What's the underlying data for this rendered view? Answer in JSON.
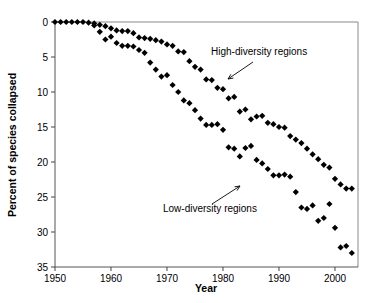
{
  "chart_data": {
    "type": "scatter",
    "title": "",
    "xlabel": "Year",
    "ylabel": "Percent of species collapsed",
    "xlim": [
      1950,
      2004
    ],
    "ylim": [
      0,
      35
    ],
    "y_inverted": true,
    "grid": false,
    "legend_position": "inline-annotations",
    "xticks": [
      1950,
      1960,
      1970,
      1980,
      1990,
      2000
    ],
    "xtick_labels": [
      "1950",
      "1960",
      "1970",
      "1980",
      "1990",
      "2000"
    ],
    "yticks": [
      0,
      5,
      10,
      15,
      20,
      25,
      30,
      35
    ],
    "ytick_labels": [
      "0",
      "5",
      "10",
      "15",
      "20",
      "25",
      "30",
      "35"
    ],
    "marker": "diamond",
    "marker_color": "#000000",
    "series": [
      {
        "name": "High-diversity regions",
        "x": [
          1950,
          1951,
          1952,
          1953,
          1954,
          1955,
          1956,
          1957,
          1958,
          1959,
          1960,
          1961,
          1962,
          1963,
          1964,
          1965,
          1966,
          1967,
          1968,
          1969,
          1970,
          1971,
          1972,
          1973,
          1974,
          1975,
          1976,
          1977,
          1978,
          1979,
          1980,
          1981,
          1982,
          1983,
          1984,
          1985,
          1986,
          1987,
          1988,
          1989,
          1990,
          1991,
          1992,
          1993,
          1994,
          1995,
          1996,
          1997,
          1998,
          1999,
          2000,
          2001,
          2002,
          2003
        ],
        "y": [
          0.0,
          0.0,
          0.0,
          0.0,
          0.0,
          0.0,
          0.1,
          0.2,
          0.4,
          0.6,
          0.9,
          1.2,
          1.3,
          1.3,
          1.6,
          2.2,
          2.3,
          2.4,
          2.6,
          2.8,
          3.2,
          3.4,
          4.2,
          4.3,
          5.6,
          6.4,
          6.8,
          8.2,
          8.3,
          9.4,
          9.6,
          10.9,
          10.7,
          12.8,
          12.5,
          13.9,
          13.5,
          13.4,
          14.4,
          14.6,
          15.0,
          15.1,
          16.3,
          16.8,
          17.3,
          18.1,
          18.9,
          19.6,
          20.4,
          20.8,
          22.4,
          23.2,
          23.8,
          23.8
        ],
        "label_position": "upper-right"
      },
      {
        "name": "Low-diversity regions",
        "x": [
          1957,
          1958,
          1959,
          1960,
          1961,
          1962,
          1963,
          1964,
          1965,
          1966,
          1967,
          1968,
          1969,
          1970,
          1971,
          1972,
          1973,
          1974,
          1975,
          1976,
          1977,
          1978,
          1979,
          1980,
          1981,
          1982,
          1983,
          1984,
          1985,
          1986,
          1987,
          1988,
          1989,
          1990,
          1991,
          1992,
          1993,
          1994,
          1995,
          1996,
          1997,
          1998,
          1999,
          2000,
          2001,
          2002,
          2003
        ],
        "y": [
          0.5,
          1.4,
          2.5,
          2.1,
          3.0,
          3.4,
          3.4,
          3.5,
          4.0,
          4.4,
          5.8,
          6.8,
          7.8,
          7.6,
          9.0,
          10.0,
          11.2,
          11.6,
          12.6,
          13.8,
          14.7,
          14.7,
          14.6,
          15.4,
          17.9,
          18.1,
          19.2,
          18.0,
          17.7,
          19.7,
          20.2,
          21.0,
          21.9,
          21.9,
          21.8,
          22.1,
          24.3,
          26.5,
          26.7,
          26.2,
          28.4,
          28.0,
          26.0,
          29.4,
          32.2,
          32.0,
          33.0
        ],
        "label_position": "lower-left"
      }
    ],
    "annotations": [
      {
        "id": "high-diversity-annotation",
        "text": "High-diversity regions",
        "text_x_px": 211,
        "text_y_px": 55,
        "arrow_from_px": [
          253,
          62
        ],
        "arrow_to_px": [
          228,
          79
        ]
      },
      {
        "id": "low-diversity-annotation",
        "text": "Low-diversity regions",
        "text_x_px": 163,
        "text_y_px": 212,
        "arrow_from_px": [
          212,
          204
        ],
        "arrow_to_px": [
          240,
          186
        ]
      }
    ]
  },
  "axes": {
    "x_title": "Year",
    "y_title": "Percent of species collapsed"
  }
}
